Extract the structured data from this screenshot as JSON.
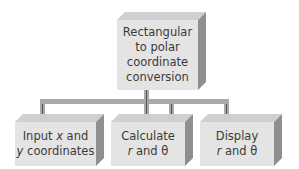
{
  "diagram": {
    "root": {
      "lines": [
        "Rectangular",
        "to polar",
        "coordinate",
        "conversion"
      ]
    },
    "children": [
      {
        "line1_a": "Input ",
        "line1_var": "x",
        "line1_b": " and",
        "line2_var": "y",
        "line2_b": " coordinates"
      },
      {
        "line1": "Calculate",
        "line2_var": "r",
        "line2_b": " and θ"
      },
      {
        "line1": "Display",
        "line2_var": "r",
        "line2_b": " and θ"
      }
    ],
    "colors": {
      "face": "#e4e4e4",
      "top": "#cfcfcf",
      "side": "#8f8f8f",
      "connector": "#a9a9a9",
      "text": "#3a3a3a"
    }
  }
}
